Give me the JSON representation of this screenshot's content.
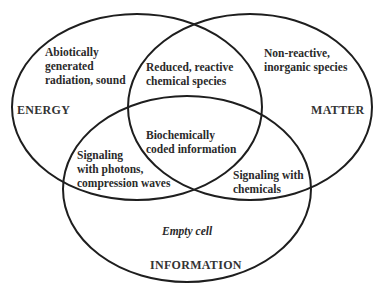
{
  "diagram": {
    "type": "venn",
    "sets": [
      {
        "id": "energy",
        "label": "ENERGY"
      },
      {
        "id": "matter",
        "label": "MATTER"
      },
      {
        "id": "information",
        "label": "INFORMATION"
      }
    ],
    "regions": {
      "energy_only": "Abiotically\ngenerated\nradiation, sound",
      "energy_matter": "Reduced, reactive\nchemical species",
      "matter_only": "Non-reactive,\ninorganic species",
      "all_three": "Biochemically\ncoded information",
      "energy_information": "Signaling\nwith photons,\ncompression waves",
      "matter_information": "Signaling with\nchemicals",
      "information_only": "Empty cell"
    },
    "colors": {
      "stroke": "#1e1e1e",
      "text": "#2a2a2a",
      "background": "#ffffff"
    }
  }
}
